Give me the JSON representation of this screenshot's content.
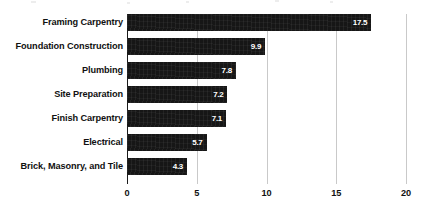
{
  "chart_data": {
    "type": "bar",
    "orientation": "horizontal",
    "title": "",
    "subtitle": "",
    "xlabel": "",
    "ylabel": "",
    "categories": [
      "Framing Carpentry",
      "Foundation Construction",
      "Plumbing",
      "Site Preparation",
      "Finish Carpentry",
      "Electrical",
      "Brick, Masonry, and Tile"
    ],
    "values": [
      17.5,
      9.9,
      7.8,
      7.2,
      7.1,
      5.7,
      4.3
    ],
    "value_labels": [
      "17.5",
      "9.9",
      "7.8",
      "7.2",
      "7.1",
      "5.7",
      "4.3"
    ],
    "xlim": [
      0,
      20
    ],
    "xticks": [
      0,
      5,
      10,
      15,
      20
    ],
    "xtick_labels": [
      "0",
      "5",
      "10",
      "15",
      "20"
    ],
    "grid": true,
    "grid_axis": "x",
    "legend": false,
    "legend_position": "none",
    "bar_color": "#161616",
    "value_label_color": "#ffffff",
    "gridline_color": "#c9c9c9",
    "axis_color": "#1a1a1a",
    "background_color": "#ffffff"
  }
}
